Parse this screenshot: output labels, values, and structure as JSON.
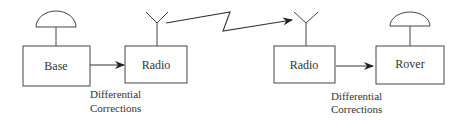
{
  "diagram": {
    "nodes": {
      "base": {
        "label": "Base"
      },
      "radio_tx": {
        "label": "Radio"
      },
      "radio_rx": {
        "label": "Radio"
      },
      "rover": {
        "label": "Rover"
      }
    },
    "edge_labels": {
      "left": {
        "line1": "Differential",
        "line2": "Corrections"
      },
      "right": {
        "line1": "Differential",
        "line2": "Corrections"
      }
    },
    "colors": {
      "stroke": "#444444",
      "text": "#333333"
    }
  }
}
